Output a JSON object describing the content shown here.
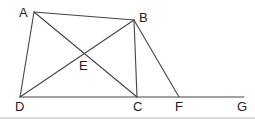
{
  "diagram": {
    "type": "geometry",
    "points": {
      "A": {
        "x": 34,
        "y": 12,
        "label": "A"
      },
      "B": {
        "x": 134,
        "y": 20,
        "label": "B"
      },
      "C": {
        "x": 137,
        "y": 97,
        "label": "C"
      },
      "D": {
        "x": 20,
        "y": 97,
        "label": "D"
      },
      "E": {
        "x": 84,
        "y": 56,
        "label": "E"
      },
      "F": {
        "x": 179,
        "y": 97,
        "label": "F"
      },
      "G": {
        "x": 244,
        "y": 97,
        "label": "G"
      }
    },
    "segments": [
      "AB",
      "AD",
      "AC",
      "BD",
      "BC",
      "BF",
      "DG"
    ],
    "labels": {
      "A": "A",
      "B": "B",
      "C": "C",
      "D": "D",
      "E": "E",
      "F": "F",
      "G": "G"
    },
    "colors": {
      "line": "#444444",
      "text": "#222222",
      "bottom_rule": "#d0d0d0"
    }
  }
}
